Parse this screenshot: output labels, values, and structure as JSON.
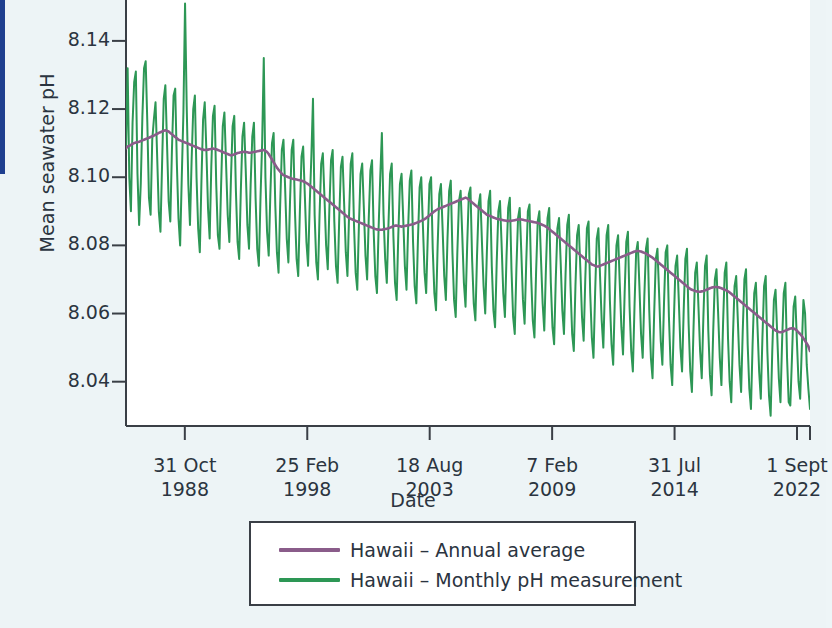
{
  "figure": {
    "background_color": "#edf4f6",
    "plot_background_color": "#ffffff",
    "accent_rule_color": "#1f3f8f"
  },
  "axes": {
    "ylabel": "Mean seawater pH",
    "xlabel": "Date",
    "y_ticks": [
      "8.14",
      "8.12",
      "8.10",
      "8.08",
      "8.06",
      "8.04"
    ],
    "x_ticks": [
      {
        "line1": "31 Oct",
        "line2": "1988"
      },
      {
        "line1": "25 Feb",
        "line2": "1998"
      },
      {
        "line1": "18 Aug",
        "line2": "2003"
      },
      {
        "line1": "7 Feb",
        "line2": "2009"
      },
      {
        "line1": "31 Jul",
        "line2": "2014"
      },
      {
        "line1": "1 Sept",
        "line2": "2022"
      }
    ]
  },
  "legend": {
    "items": [
      {
        "label": "Hawaii – Annual average",
        "color": "#8a5c8a"
      },
      {
        "label": "Hawaii – Monthly pH measurement",
        "color": "#2d9755"
      }
    ]
  },
  "chart_data": {
    "type": "line",
    "title": "",
    "subtitle": "",
    "xlabel": "Date",
    "ylabel": "Mean seawater pH",
    "grid": false,
    "legend_position": "bottom",
    "ylim": [
      8.027,
      8.152
    ],
    "y_tick_values": [
      8.14,
      8.12,
      8.1,
      8.08,
      8.06,
      8.04
    ],
    "x_tick_labels": [
      "31 Oct 1988",
      "25 Feb 1998",
      "18 Aug 2003",
      "7 Feb 2009",
      "31 Jul 2014",
      "1 Sept 2022"
    ],
    "x_tick_positions": [
      0.086,
      0.265,
      0.444,
      0.623,
      0.802,
      0.981
    ],
    "series": [
      {
        "name": "Hawaii – Monthly pH measurement",
        "color": "#2d9755",
        "linewidth": 2.0,
        "values": [
          8.109,
          8.132,
          8.1,
          8.09,
          8.116,
          8.128,
          8.131,
          8.101,
          8.086,
          8.098,
          8.118,
          8.132,
          8.134,
          8.116,
          8.094,
          8.089,
          8.111,
          8.117,
          8.122,
          8.106,
          8.09,
          8.084,
          8.104,
          8.123,
          8.127,
          8.11,
          8.093,
          8.087,
          8.108,
          8.124,
          8.126,
          8.104,
          8.088,
          8.08,
          8.1,
          8.119,
          8.151,
          8.121,
          8.098,
          8.086,
          8.105,
          8.12,
          8.124,
          8.1,
          8.085,
          8.078,
          8.099,
          8.117,
          8.122,
          8.108,
          8.091,
          8.082,
          8.103,
          8.118,
          8.121,
          8.098,
          8.083,
          8.079,
          8.098,
          8.115,
          8.119,
          8.104,
          8.089,
          8.081,
          8.1,
          8.115,
          8.118,
          8.096,
          8.081,
          8.076,
          8.096,
          8.112,
          8.116,
          8.102,
          8.086,
          8.079,
          8.098,
          8.112,
          8.116,
          8.094,
          8.079,
          8.074,
          8.094,
          8.11,
          8.135,
          8.1,
          8.084,
          8.077,
          8.095,
          8.11,
          8.113,
          8.092,
          8.078,
          8.072,
          8.092,
          8.108,
          8.111,
          8.097,
          8.082,
          8.075,
          8.093,
          8.108,
          8.111,
          8.09,
          8.076,
          8.071,
          8.09,
          8.106,
          8.109,
          8.095,
          8.081,
          8.074,
          8.092,
          8.106,
          8.123,
          8.089,
          8.075,
          8.07,
          8.089,
          8.104,
          8.107,
          8.094,
          8.08,
          8.073,
          8.091,
          8.105,
          8.108,
          8.087,
          8.074,
          8.069,
          8.088,
          8.103,
          8.106,
          8.092,
          8.078,
          8.071,
          8.089,
          8.104,
          8.107,
          8.086,
          8.072,
          8.067,
          8.086,
          8.101,
          8.104,
          8.091,
          8.077,
          8.07,
          8.088,
          8.102,
          8.105,
          8.084,
          8.071,
          8.066,
          8.085,
          8.1,
          8.113,
          8.089,
          8.076,
          8.069,
          8.086,
          8.101,
          8.104,
          8.083,
          8.069,
          8.064,
          8.083,
          8.098,
          8.101,
          8.088,
          8.074,
          8.067,
          8.085,
          8.099,
          8.102,
          8.081,
          8.068,
          8.063,
          8.082,
          8.097,
          8.1,
          8.086,
          8.072,
          8.066,
          8.083,
          8.098,
          8.1,
          8.079,
          8.066,
          8.061,
          8.08,
          8.095,
          8.098,
          8.085,
          8.071,
          8.064,
          8.082,
          8.096,
          8.099,
          8.078,
          8.064,
          8.059,
          8.078,
          8.093,
          8.096,
          8.083,
          8.069,
          8.062,
          8.08,
          8.095,
          8.097,
          8.076,
          8.063,
          8.058,
          8.077,
          8.092,
          8.095,
          8.081,
          8.068,
          8.06,
          8.078,
          8.093,
          8.096,
          8.074,
          8.061,
          8.056,
          8.075,
          8.09,
          8.093,
          8.08,
          8.066,
          8.059,
          8.077,
          8.091,
          8.094,
          8.073,
          8.059,
          8.054,
          8.073,
          8.088,
          8.091,
          8.078,
          8.064,
          8.057,
          8.075,
          8.09,
          8.092,
          8.071,
          8.058,
          8.053,
          8.072,
          8.087,
          8.09,
          8.076,
          8.063,
          8.055,
          8.073,
          8.088,
          8.091,
          8.069,
          8.056,
          8.051,
          8.07,
          8.085,
          8.088,
          8.075,
          8.061,
          8.054,
          8.072,
          8.086,
          8.089,
          8.068,
          8.054,
          8.049,
          8.068,
          8.083,
          8.086,
          8.073,
          8.059,
          8.052,
          8.07,
          8.085,
          8.087,
          8.066,
          8.053,
          8.047,
          8.066,
          8.082,
          8.085,
          8.071,
          8.058,
          8.05,
          8.068,
          8.083,
          8.086,
          8.064,
          8.051,
          8.045,
          8.064,
          8.08,
          8.083,
          8.069,
          8.056,
          8.048,
          8.066,
          8.081,
          8.084,
          8.062,
          8.049,
          8.043,
          8.062,
          8.078,
          8.081,
          8.068,
          8.054,
          8.047,
          8.065,
          8.079,
          8.082,
          8.061,
          8.047,
          8.041,
          8.06,
          8.076,
          8.079,
          8.066,
          8.052,
          8.045,
          8.063,
          8.078,
          8.08,
          8.059,
          8.045,
          8.039,
          8.058,
          8.074,
          8.077,
          8.064,
          8.05,
          8.043,
          8.061,
          8.076,
          8.079,
          8.057,
          8.043,
          8.037,
          8.056,
          8.072,
          8.075,
          8.062,
          8.049,
          8.041,
          8.059,
          8.074,
          8.077,
          8.055,
          8.042,
          8.036,
          8.055,
          8.07,
          8.073,
          8.06,
          8.047,
          8.039,
          8.057,
          8.072,
          8.075,
          8.053,
          8.04,
          8.034,
          8.053,
          8.068,
          8.071,
          8.058,
          8.045,
          8.037,
          8.055,
          8.07,
          8.073,
          8.051,
          8.038,
          8.032,
          8.051,
          8.066,
          8.069,
          8.056,
          8.043,
          8.035,
          8.053,
          8.068,
          8.071,
          8.049,
          8.036,
          8.03,
          8.049,
          8.064,
          8.067,
          8.054,
          8.041,
          8.034,
          8.052,
          8.066,
          8.069,
          8.047,
          8.034,
          8.033,
          8.047,
          8.062,
          8.065,
          8.052,
          8.04,
          8.035,
          8.05,
          8.064,
          8.06,
          8.045,
          8.038,
          8.032
        ]
      },
      {
        "name": "Hawaii – Annual average",
        "color": "#8a5c8a",
        "linewidth": 2.4,
        "values": [
          8.1085,
          8.109,
          8.1092,
          8.1095,
          8.1098,
          8.11,
          8.1102,
          8.1103,
          8.1104,
          8.1106,
          8.1108,
          8.111,
          8.1112,
          8.1114,
          8.1116,
          8.1118,
          8.112,
          8.1122,
          8.1125,
          8.1127,
          8.113,
          8.1132,
          8.1134,
          8.1136,
          8.1138,
          8.1136,
          8.1134,
          8.113,
          8.1126,
          8.1122,
          8.1118,
          8.1114,
          8.111,
          8.1108,
          8.1106,
          8.1104,
          8.1102,
          8.11,
          8.1098,
          8.1096,
          8.1094,
          8.1092,
          8.109,
          8.1088,
          8.1086,
          8.1084,
          8.1082,
          8.1081,
          8.108,
          8.108,
          8.1081,
          8.1082,
          8.1083,
          8.1084,
          8.1083,
          8.1082,
          8.108,
          8.1078,
          8.1076,
          8.1074,
          8.1072,
          8.107,
          8.1068,
          8.1066,
          8.1064,
          8.1065,
          8.1067,
          8.1069,
          8.1071,
          8.1072,
          8.1073,
          8.1074,
          8.1075,
          8.1074,
          8.1073,
          8.1072,
          8.1072,
          8.1073,
          8.1074,
          8.1075,
          8.1076,
          8.1077,
          8.1078,
          8.1079,
          8.108,
          8.1078,
          8.1074,
          8.1068,
          8.106,
          8.1052,
          8.1044,
          8.1036,
          8.1028,
          8.1022,
          8.1016,
          8.101,
          8.1006,
          8.1004,
          8.1002,
          8.1,
          8.0998,
          8.0996,
          8.0995,
          8.0994,
          8.0993,
          8.0992,
          8.0991,
          8.099,
          8.0988,
          8.0986,
          8.0983,
          8.098,
          8.0976,
          8.0972,
          8.0968,
          8.0964,
          8.096,
          8.0956,
          8.0952,
          8.0948,
          8.0944,
          8.094,
          8.0936,
          8.0932,
          8.0928,
          8.0924,
          8.092,
          8.0916,
          8.0912,
          8.0908,
          8.0904,
          8.09,
          8.0896,
          8.0892,
          8.0888,
          8.0884,
          8.088,
          8.0878,
          8.0876,
          8.0874,
          8.0872,
          8.087,
          8.0868,
          8.0866,
          8.0864,
          8.0862,
          8.086,
          8.0858,
          8.0856,
          8.0854,
          8.0852,
          8.085,
          8.0848,
          8.0847,
          8.0846,
          8.0846,
          8.0846,
          8.0847,
          8.0848,
          8.0849,
          8.085,
          8.0852,
          8.0854,
          8.0856,
          8.0858,
          8.0858,
          8.0857,
          8.0856,
          8.0855,
          8.0856,
          8.0857,
          8.0858,
          8.0859,
          8.086,
          8.0861,
          8.0862,
          8.0864,
          8.0866,
          8.0868,
          8.087,
          8.0872,
          8.0874,
          8.0877,
          8.088,
          8.0884,
          8.0888,
          8.0892,
          8.0896,
          8.09,
          8.0903,
          8.0906,
          8.0908,
          8.091,
          8.0912,
          8.0914,
          8.0916,
          8.0918,
          8.092,
          8.0922,
          8.0924,
          8.0926,
          8.0928,
          8.093,
          8.0932,
          8.0934,
          8.0936,
          8.0938,
          8.094,
          8.0938,
          8.0934,
          8.093,
          8.0926,
          8.0922,
          8.0918,
          8.0914,
          8.091,
          8.0906,
          8.0902,
          8.0898,
          8.0894,
          8.089,
          8.0888,
          8.0886,
          8.0884,
          8.0882,
          8.088,
          8.0878,
          8.0877,
          8.0876,
          8.0875,
          8.0874,
          8.0873,
          8.0872,
          8.0872,
          8.0872,
          8.0872,
          8.0873,
          8.0874,
          8.0875,
          8.0876,
          8.0877,
          8.0876,
          8.0875,
          8.0874,
          8.0873,
          8.0872,
          8.0871,
          8.087,
          8.0869,
          8.0868,
          8.0867,
          8.0866,
          8.0864,
          8.0862,
          8.086,
          8.0858,
          8.0855,
          8.0852,
          8.0848,
          8.0844,
          8.084,
          8.0836,
          8.0832,
          8.0828,
          8.0824,
          8.082,
          8.0816,
          8.0812,
          8.0808,
          8.0804,
          8.08,
          8.0796,
          8.0792,
          8.0788,
          8.0784,
          8.078,
          8.0776,
          8.0772,
          8.0768,
          8.0764,
          8.076,
          8.0756,
          8.0752,
          8.0748,
          8.0744,
          8.0742,
          8.074,
          8.0738,
          8.0738,
          8.074,
          8.0742,
          8.0744,
          8.0746,
          8.0748,
          8.075,
          8.0752,
          8.0754,
          8.0756,
          8.0758,
          8.076,
          8.0762,
          8.0764,
          8.0766,
          8.0768,
          8.077,
          8.0772,
          8.0774,
          8.0776,
          8.0778,
          8.078,
          8.0782,
          8.0783,
          8.0784,
          8.0783,
          8.0782,
          8.078,
          8.0778,
          8.0776,
          8.0773,
          8.077,
          8.0767,
          8.0764,
          8.076,
          8.0756,
          8.0752,
          8.0748,
          8.0744,
          8.074,
          8.0736,
          8.0732,
          8.0728,
          8.0724,
          8.072,
          8.0716,
          8.0712,
          8.0708,
          8.0704,
          8.07,
          8.0696,
          8.0692,
          8.0688,
          8.0684,
          8.068,
          8.0676,
          8.0672,
          8.067,
          8.0668,
          8.0666,
          8.0665,
          8.0664,
          8.0664,
          8.0665,
          8.0666,
          8.0668,
          8.067,
          8.0672,
          8.0674,
          8.0676,
          8.0677,
          8.0678,
          8.0678,
          8.0677,
          8.0676,
          8.0674,
          8.0672,
          8.067,
          8.0668,
          8.0665,
          8.0662,
          8.0658,
          8.0654,
          8.065,
          8.0646,
          8.0642,
          8.0638,
          8.0634,
          8.063,
          8.0626,
          8.0622,
          8.0618,
          8.0614,
          8.061,
          8.0606,
          8.0602,
          8.0598,
          8.0594,
          8.059,
          8.0586,
          8.0582,
          8.0578,
          8.0574,
          8.057,
          8.0566,
          8.0562,
          8.0558,
          8.0554,
          8.055,
          8.0548,
          8.0546,
          8.0545,
          8.0546,
          8.0548,
          8.055,
          8.0552,
          8.0554,
          8.0556,
          8.0557,
          8.0556,
          8.0554,
          8.055,
          8.0545,
          8.054,
          8.0534,
          8.0527,
          8.052,
          8.0512,
          8.0504,
          8.049
        ]
      }
    ]
  }
}
